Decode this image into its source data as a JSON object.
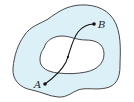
{
  "diagram": {
    "colors": {
      "region_fill": "#dcf0f7",
      "hole_fill": "#ffffff",
      "stroke": "#333333",
      "path": "#111111"
    },
    "points": {
      "a": {
        "label": "A",
        "x": 45,
        "y": 84
      },
      "b": {
        "label": "B",
        "x": 94,
        "y": 24
      },
      "mid": {
        "x": 68,
        "y": 57
      }
    }
  }
}
